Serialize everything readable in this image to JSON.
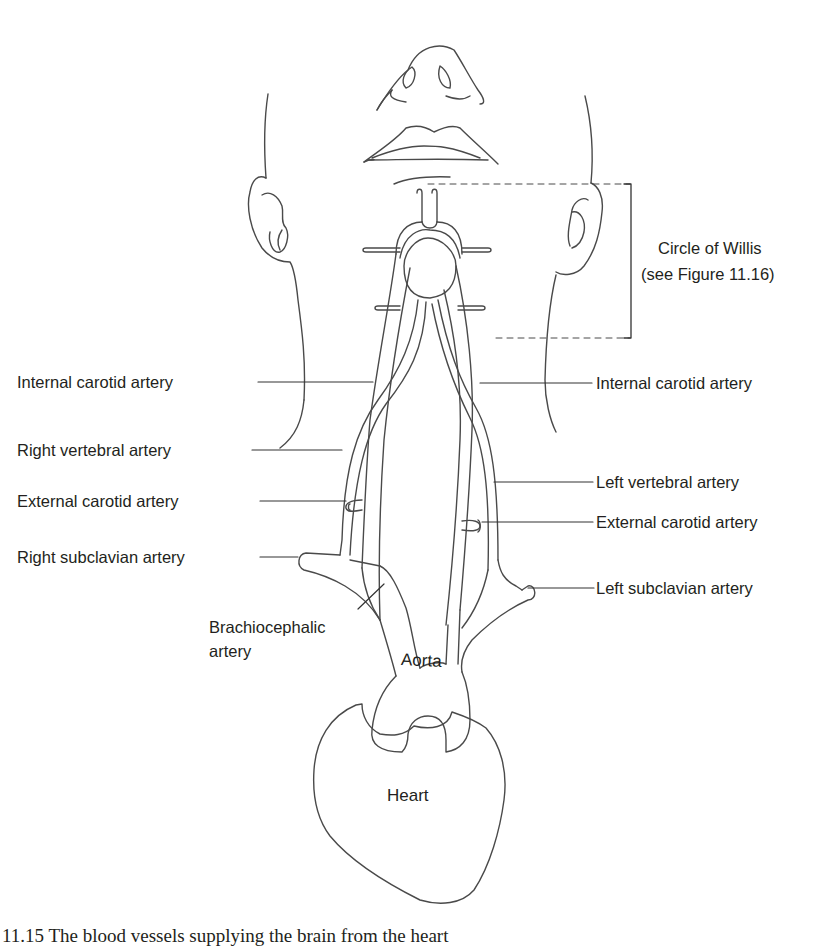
{
  "figure": {
    "caption": "11.15 The blood vessels supplying the brain from the heart",
    "stroke_color": "#4a4a4a",
    "text_color": "#231f20",
    "bracket_label": {
      "line1": "Circle of Willis",
      "line2": "(see Figure 11.16)"
    },
    "labels_left": {
      "internal_carotid": "Internal carotid artery",
      "right_vertebral": "Right vertebral artery",
      "external_carotid": "External carotid artery",
      "right_subclavian": "Right subclavian artery",
      "brachiocephalic_1": "Brachiocephalic",
      "brachiocephalic_2": "artery"
    },
    "labels_right": {
      "internal_carotid": "Internal carotid artery",
      "left_vertebral": "Left vertebral artery",
      "external_carotid": "External carotid artery",
      "left_subclavian": "Left subclavian artery"
    },
    "organs": {
      "aorta": "Aorta",
      "heart": "Heart"
    }
  }
}
